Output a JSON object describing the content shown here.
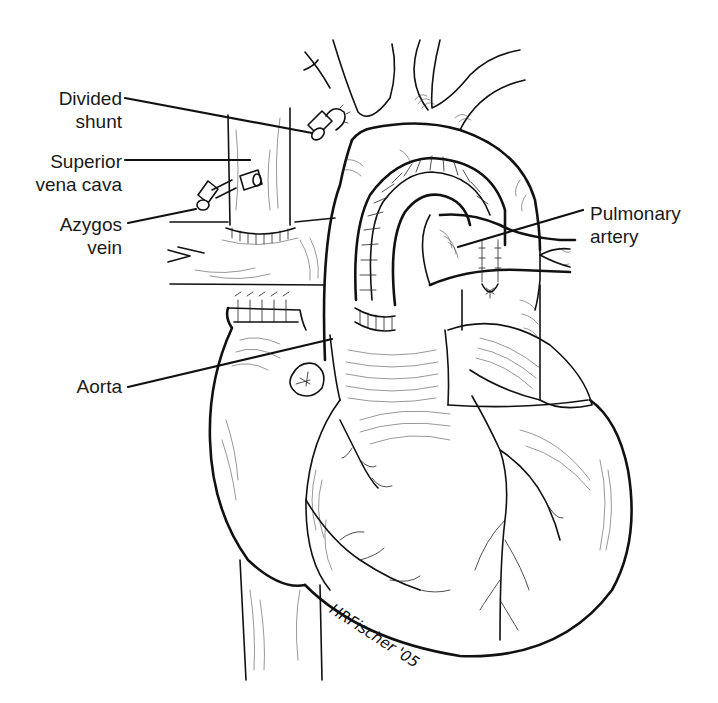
{
  "figure": {
    "labels": [
      {
        "id": "divided-shunt",
        "lines": [
          "Divided",
          "shunt"
        ],
        "side": "left"
      },
      {
        "id": "superior-vena-cava",
        "lines": [
          "Superior",
          "vena cava"
        ],
        "side": "left"
      },
      {
        "id": "azygos-vein",
        "lines": [
          "Azygos",
          "vein"
        ],
        "side": "left"
      },
      {
        "id": "aorta",
        "lines": [
          "Aorta"
        ],
        "side": "left"
      },
      {
        "id": "pulmonary-artery",
        "lines": [
          "Pulmonary",
          "artery"
        ],
        "side": "right"
      }
    ],
    "signature": "HRFischer '05"
  },
  "colors": {
    "ink": "#111111",
    "background": "#ffffff"
  }
}
